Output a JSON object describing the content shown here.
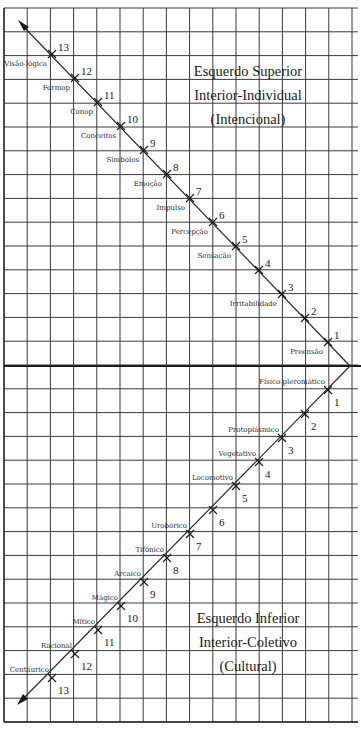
{
  "diagram": {
    "upper_quadrant": {
      "title_line1": "Esquerdo Superior",
      "title_line2": "Interior-Individual",
      "title_line3": "(Intencional)"
    },
    "lower_quadrant": {
      "title_line1": "Esquerdo Inferior",
      "title_line2": "Interior-Coletivo",
      "title_line3": "(Cultural)"
    },
    "upper_levels": [
      {
        "num": "1",
        "label": "Preensão"
      },
      {
        "num": "2",
        "label": ""
      },
      {
        "num": "3",
        "label": "Irritabilidade"
      },
      {
        "num": "4",
        "label": ""
      },
      {
        "num": "5",
        "label": "Sensação"
      },
      {
        "num": "6",
        "label": "Percepção"
      },
      {
        "num": "7",
        "label": "Impulso"
      },
      {
        "num": "8",
        "label": "Emoção"
      },
      {
        "num": "9",
        "label": "Símbolos"
      },
      {
        "num": "10",
        "label": "Conceitos"
      },
      {
        "num": "11",
        "label": "Conop"
      },
      {
        "num": "12",
        "label": "Formop"
      },
      {
        "num": "13",
        "label": "Visão-lógica"
      }
    ],
    "lower_levels": [
      {
        "num": "1",
        "label": "Físico-pleromático"
      },
      {
        "num": "2",
        "label": ""
      },
      {
        "num": "3",
        "label": "Protoplásmico"
      },
      {
        "num": "4",
        "label": "Vegetativo"
      },
      {
        "num": "5",
        "label": "Locomotivo"
      },
      {
        "num": "6",
        "label": ""
      },
      {
        "num": "7",
        "label": "Urobórico"
      },
      {
        "num": "8",
        "label": "Tifônico"
      },
      {
        "num": "9",
        "label": "Arcaico"
      },
      {
        "num": "10",
        "label": "Mágico"
      },
      {
        "num": "11",
        "label": "Mítico"
      },
      {
        "num": "12",
        "label": "Racional"
      },
      {
        "num": "13",
        "label": "Centáurico"
      }
    ],
    "colors": {
      "background": "#ffffff",
      "ink": "#1a1a1a",
      "grid": "#3a3a3a"
    }
  }
}
